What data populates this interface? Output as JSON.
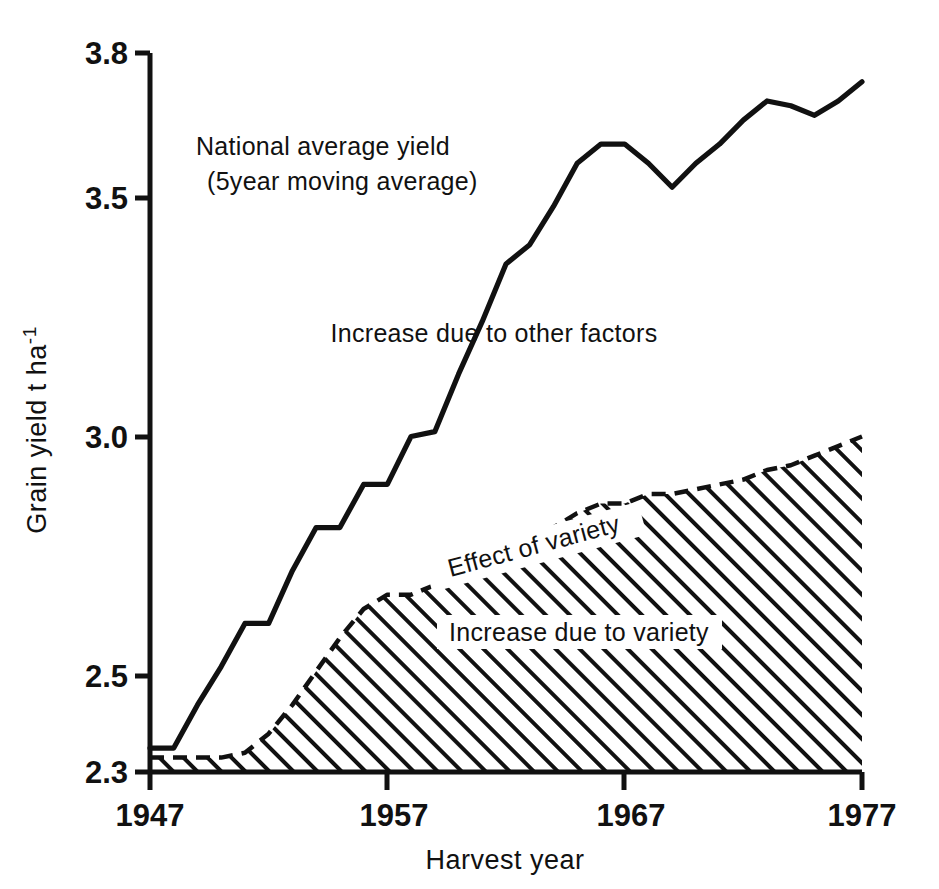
{
  "figure": {
    "background_color": "#ffffff",
    "ink_color": "#111111"
  },
  "axes": {
    "y_title_main": "Grain yield  t  ha",
    "y_title_exponent": "-1",
    "x_title": "Harvest year",
    "y_ticks": [
      "3.8",
      "3.5",
      "3.0",
      "2.5",
      "2.3"
    ],
    "x_ticks": [
      "1947",
      "1957",
      "1967",
      "1977"
    ]
  },
  "annotations": {
    "national_line1": "National average yield",
    "national_line2": "(5year moving average)",
    "other_factors": "Increase due to other factors",
    "effect_of_variety": "Effect of variety",
    "increase_due_to_variety": "Increase due to variety"
  },
  "chart_data": {
    "type": "area",
    "title": "",
    "xlabel": "Harvest year",
    "ylabel": "Grain yield t ha-1",
    "xlim": [
      1947,
      1977
    ],
    "ylim": [
      2.3,
      3.8
    ],
    "grid": false,
    "legend": "inline annotations",
    "x": [
      1947,
      1948,
      1949,
      1950,
      1951,
      1952,
      1953,
      1954,
      1955,
      1956,
      1957,
      1958,
      1959,
      1960,
      1961,
      1962,
      1963,
      1964,
      1965,
      1966,
      1967,
      1968,
      1969,
      1970,
      1971,
      1972,
      1973,
      1974,
      1975,
      1976,
      1977
    ],
    "series": [
      {
        "name": "National average yield (5year moving average)",
        "style": "solid-line",
        "values": [
          2.35,
          2.35,
          2.44,
          2.52,
          2.61,
          2.61,
          2.72,
          2.81,
          2.81,
          2.9,
          2.9,
          3.0,
          3.01,
          3.13,
          3.24,
          3.36,
          3.4,
          3.48,
          3.57,
          3.61,
          3.61,
          3.57,
          3.52,
          3.57,
          3.61,
          3.66,
          3.7,
          3.69,
          3.67,
          3.7,
          3.74
        ]
      },
      {
        "name": "Effect of variety (upper boundary of hatched band)",
        "style": "dashed-line",
        "values": [
          2.33,
          2.33,
          2.33,
          2.33,
          2.34,
          2.38,
          2.44,
          2.51,
          2.58,
          2.64,
          2.67,
          2.67,
          2.69,
          2.71,
          2.73,
          2.76,
          2.79,
          2.81,
          2.84,
          2.86,
          2.86,
          2.88,
          2.88,
          2.89,
          2.9,
          2.91,
          2.93,
          2.94,
          2.96,
          2.98,
          3.0
        ]
      }
    ],
    "baseline": 2.3,
    "regions": [
      {
        "name": "Increase due to variety",
        "fill": "diagonal-hatch",
        "between": [
          "baseline",
          "Effect of variety"
        ]
      },
      {
        "name": "Increase due to other factors",
        "fill": "none",
        "between": [
          "Effect of variety",
          "National average yield"
        ]
      }
    ]
  }
}
